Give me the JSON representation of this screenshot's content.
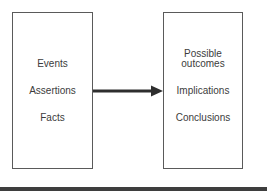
{
  "diagram": {
    "left_box": {
      "items": [
        "Events",
        "Assertions",
        "Facts"
      ]
    },
    "right_box": {
      "items": [
        "Possible outcomes",
        "Implications",
        "Conclusions"
      ],
      "first_item_lines": [
        "Possible",
        "outcomes"
      ]
    },
    "arrow": {
      "direction": "right",
      "from": "left_box",
      "to": "right_box"
    },
    "colors": {
      "stroke": "#5a5a5a",
      "arrow": "#2e2e2e",
      "text": "#3c3c3c",
      "bottom_rule": "#3e3e3e",
      "background": "#ffffff"
    }
  }
}
